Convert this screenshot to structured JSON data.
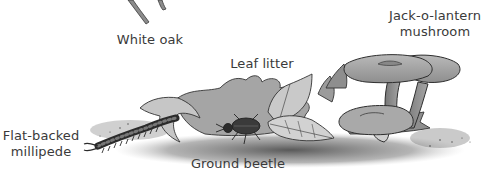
{
  "diagram": {
    "type": "labeled-illustration",
    "labels": {
      "white_oak": "White oak",
      "leaf_litter": "Leaf litter",
      "jack_o_lantern_line1": "Jack-o-lantern",
      "jack_o_lantern_line2": "mushroom",
      "millipede_line1": "Flat-backed",
      "millipede_line2": "millipede",
      "ground_beetle": "Ground beetle"
    },
    "elements": [
      {
        "id": "white-oak",
        "label": "White oak",
        "depiction": "oak twig stems at top edge"
      },
      {
        "id": "leaf-litter",
        "label": "Leaf litter",
        "depiction": "pile of oak and toothed leaves"
      },
      {
        "id": "jack-o-lantern-mushroom",
        "label": "Jack-o-lantern mushroom",
        "depiction": "cluster of funnel-capped mushrooms"
      },
      {
        "id": "flat-backed-millipede",
        "label": "Flat-backed millipede",
        "depiction": "segmented millipede emerging left"
      },
      {
        "id": "ground-beetle",
        "label": "Ground beetle",
        "depiction": "dark beetle beneath leaves"
      }
    ],
    "colors": {
      "text": "#3a3a3a",
      "ink": "#2e2e2e",
      "leaf_light": "#c9c9c9",
      "leaf_mid": "#a8a8a8",
      "leaf_dark": "#8a8a8a",
      "soil": "#555555",
      "background": "#ffffff"
    }
  }
}
